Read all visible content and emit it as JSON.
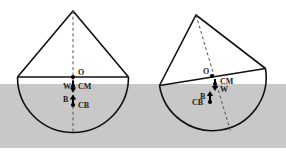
{
  "figure": {
    "caption_present": false,
    "background_color": "#ffffff",
    "water": {
      "name": "water-region",
      "fill_color": "#c8c8c8",
      "top_y": 84,
      "bottom_y": 148,
      "left_x": 0,
      "right_x": 286
    },
    "line_color": "#111111",
    "dash_color": "#555555",
    "marker_color": "#000000"
  },
  "panels": [
    {
      "id": "left",
      "name": "upright-floating-cone",
      "apex": {
        "x": 73,
        "y": 11
      },
      "base_left": {
        "x": 17,
        "y": 77
      },
      "base_right": {
        "x": 128,
        "y": 77
      },
      "hemisphere_bottom": {
        "x": 73,
        "y": 133
      },
      "radius": 55.5,
      "axis": {
        "x1": 73,
        "y1": 11,
        "x2": 73,
        "y2": 133
      },
      "points": [
        {
          "label": "O",
          "name": "point-o",
          "x": 73,
          "y": 77,
          "label_dx": 5,
          "label_dy": -2
        },
        {
          "label": "CM",
          "name": "point-cm",
          "x": 73,
          "y": 87,
          "label_dx": 5,
          "label_dy": 2
        },
        {
          "label": "CB",
          "name": "point-cb",
          "x": 73,
          "y": 103,
          "label_dx": 5,
          "label_dy": 3
        }
      ],
      "forces": [
        {
          "label": "W",
          "name": "weight-arrow",
          "direction": "down",
          "x": 73,
          "y_tail": 80,
          "y_head": 92,
          "label_dx": -10,
          "label_dy": 3
        },
        {
          "label": "B",
          "name": "buoyancy-arrow",
          "direction": "up",
          "x": 73,
          "y_tail": 107,
          "y_head": 95,
          "label_dx": -10,
          "label_dy": -1
        }
      ]
    },
    {
      "id": "right",
      "name": "tilted-floating-cone",
      "apex": {
        "x": 196,
        "y": 15
      },
      "base_left": {
        "x": 160,
        "y": 85
      },
      "base_right": {
        "x": 265,
        "y": 68
      },
      "hemisphere_bottom": {
        "x": 219,
        "y": 134
      },
      "radius": 53.5,
      "tilt_degrees": -9,
      "axis": {
        "x1": 196,
        "y1": 15,
        "x2": 231,
        "y2": 133
      },
      "points": [
        {
          "label": "O",
          "name": "point-o",
          "x": 211,
          "y": 74,
          "label_dx": -9,
          "label_dy": -2
        },
        {
          "label": "CM",
          "name": "point-cm",
          "x": 214,
          "y": 83,
          "label_dx": 5,
          "label_dy": 1
        },
        {
          "label": "CB",
          "name": "point-cb",
          "x": 210,
          "y": 100,
          "label_dx": -18,
          "label_dy": 3
        }
      ],
      "forces": [
        {
          "label": "W",
          "name": "weight-arrow",
          "direction": "down",
          "x": 214,
          "y_tail": 78,
          "y_head": 90,
          "label_dx": 5,
          "label_dy": 9
        },
        {
          "label": "B",
          "name": "buoyancy-arrow",
          "direction": "up",
          "x": 210,
          "y_tail": 104,
          "y_head": 92,
          "label_dx": -9,
          "label_dy": -3
        }
      ]
    }
  ],
  "legend_keys": {
    "O": "geometric-center",
    "CM": "center-of-mass",
    "CB": "center-of-buoyancy",
    "W": "weight-force",
    "B": "buoyancy-force"
  }
}
